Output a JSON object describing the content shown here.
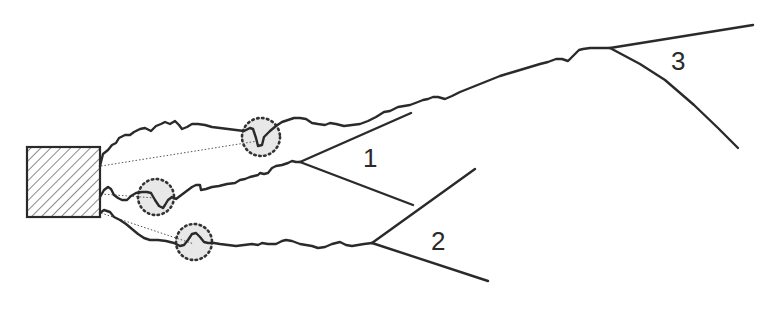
{
  "diagram": {
    "type": "crack-path-schematic",
    "colors": {
      "line": "#2a2a2a",
      "hatch": "#555555",
      "circle_fill": "#e6e6e6",
      "dotted": "#333333",
      "background": "#ffffff"
    },
    "source_block": {
      "shape": "hatched-rectangle",
      "x": 27,
      "y": 147,
      "width": 73,
      "height": 70
    },
    "paths": [
      {
        "id": "path-1",
        "label": "1",
        "label_position": {
          "x": 362,
          "y": 145
        },
        "feature_circle": {
          "cx": 260,
          "cy": 137,
          "r": 19
        },
        "fork_point": {
          "x": 300,
          "y": 162
        }
      },
      {
        "id": "path-2",
        "label": "2",
        "label_position": {
          "x": 433,
          "y": 228
        },
        "feature_circle": {
          "cx": 155,
          "cy": 196,
          "r": 18
        },
        "fork_point": {
          "x": 372,
          "y": 243
        }
      },
      {
        "id": "path-3",
        "label": "3",
        "label_position": {
          "x": 672,
          "y": 48
        },
        "feature_circle": {
          "cx": 193,
          "cy": 241,
          "r": 18
        },
        "fork_point": {
          "x": 610,
          "y": 48
        }
      }
    ]
  }
}
